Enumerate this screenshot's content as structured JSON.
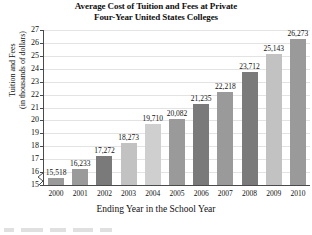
{
  "chart_data": {
    "type": "bar",
    "title": "Average Cost of Tuition and Fees at Private Four-Year United States Colleges",
    "title_line1": "Average Cost of Tuition and Fees at Private",
    "title_line2": "Four-Year United States Colleges",
    "xlabel": "Ending Year in the School Year",
    "ylabel": "Tuition and Fees (in thousands of dollars)",
    "ylabel_line1": "Tuition and Fees",
    "ylabel_line2": "(in thousands of dollars)",
    "categories": [
      "2000",
      "2001",
      "2002",
      "2003",
      "2004",
      "2005",
      "2006",
      "2007",
      "2008",
      "2009",
      "2010"
    ],
    "values": [
      15518,
      16233,
      17272,
      18273,
      19710,
      20082,
      21235,
      22218,
      23712,
      25143,
      26273
    ],
    "data_labels": [
      "15,518",
      "16,233",
      "17,272",
      "18,273",
      "19,710",
      "20,082",
      "21,235",
      "22,218",
      "23,712",
      "25,143",
      "26,273"
    ],
    "bar_shades": [
      "mid",
      "mid",
      "dark",
      "light",
      "xlight",
      "mid",
      "dark",
      "mid",
      "dark",
      "light",
      "mid"
    ],
    "ylim": [
      15,
      27
    ],
    "yticks": [
      27,
      26,
      25,
      24,
      23,
      22,
      21,
      20,
      19,
      18,
      17,
      16,
      15
    ],
    "ytick_labels": [
      "27",
      "26",
      "25",
      "24",
      "23",
      "22",
      "21",
      "20",
      "19",
      "18",
      "17",
      "16",
      "15"
    ],
    "y_unit": "thousands of dollars",
    "grid": true,
    "grid_axis": "y",
    "legend": false,
    "axis_break": true,
    "bar_color": "#8c8c8c",
    "grid_color": "#e3e3e3",
    "axis_color": "#4a4a4a"
  }
}
